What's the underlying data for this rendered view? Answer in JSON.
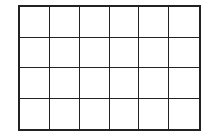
{
  "grid": {
    "columns": 6,
    "rows": 4,
    "line_color": "#222222",
    "cell_color": "#ffffff"
  }
}
